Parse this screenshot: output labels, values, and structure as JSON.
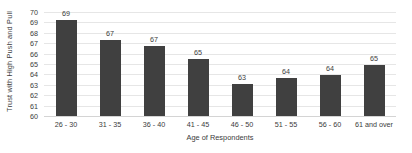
{
  "chart_data": {
    "type": "bar",
    "title": "",
    "xlabel": "Age of Respondents",
    "ylabel": "Trust with High Push and Pull",
    "categories": [
      "26 - 30",
      "31 - 35",
      "36 - 40",
      "41 - 45",
      "46 - 50",
      "51 - 55",
      "56 - 60",
      "61 and over"
    ],
    "values": [
      69,
      67,
      67,
      65,
      63,
      64,
      64,
      65
    ],
    "bar_tops": [
      69.2,
      67.3,
      66.7,
      65.45,
      63.1,
      63.7,
      63.9,
      64.95
    ],
    "data_labels": [
      "69",
      "67",
      "67",
      "65",
      "63",
      "64",
      "64",
      "65"
    ],
    "ylim": [
      60,
      70
    ],
    "ytick_labels": [
      "70",
      "69",
      "68",
      "67",
      "66",
      "65",
      "64",
      "63",
      "62",
      "61",
      "60"
    ],
    "ytick_values": [
      70,
      69,
      68,
      67,
      66,
      65,
      64,
      63,
      62,
      61,
      60
    ],
    "grid": true,
    "legend": false,
    "bar_color": "#404040",
    "gridline_color": "#e6e6e6",
    "text_color": "#3b3b3b",
    "background_color": "#ffffff"
  }
}
